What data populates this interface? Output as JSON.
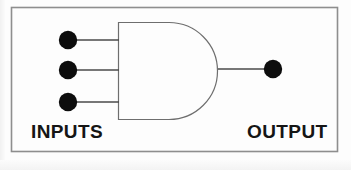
{
  "diagram": {
    "type": "logic-gate-schematic",
    "gate": {
      "name": "AND gate",
      "symbol_style": "distinctive-shape (MIL/ANSI)",
      "input_count": 3,
      "output_count": 1
    },
    "labels": {
      "inputs": "INPUTS",
      "output": "OUTPUT"
    },
    "colors": {
      "background": "#fdfdfd",
      "frame_stroke": "#8e8e8e",
      "gate_stroke": "#6e6e6e",
      "wire_stroke": "#4a4a4a",
      "terminal_fill": "#0d0d0d",
      "label_text": "#151515"
    },
    "geometry": {
      "frame": {
        "x": 11,
        "y": 7,
        "width": 327,
        "height": 145
      },
      "gate_body": {
        "left": 118,
        "top": 22,
        "bottom": 119,
        "arc_right": 220
      },
      "input_terminals": [
        {
          "cx": 68,
          "cy": 40,
          "r": 9
        },
        {
          "cx": 68,
          "cy": 70,
          "r": 9
        },
        {
          "cx": 68,
          "cy": 102,
          "r": 9
        }
      ],
      "output_terminal": {
        "cx": 273,
        "cy": 69,
        "r": 9
      },
      "input_wires": [
        {
          "x1": 77,
          "y1": 40,
          "x2": 118,
          "y2": 40
        },
        {
          "x1": 77,
          "y1": 70,
          "x2": 118,
          "y2": 70
        },
        {
          "x1": 77,
          "y1": 102,
          "x2": 118,
          "y2": 102
        }
      ],
      "output_wire": {
        "x1": 220,
        "y1": 69,
        "x2": 264,
        "y2": 69
      }
    }
  }
}
